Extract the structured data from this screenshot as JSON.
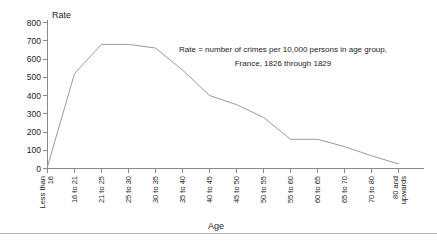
{
  "chart_data": {
    "type": "line",
    "title": "",
    "xlabel": "Age",
    "ylabel": "Rate",
    "ylim": [
      0,
      800
    ],
    "ytick_labels": [
      "0",
      "100",
      "200",
      "300",
      "400",
      "500",
      "600",
      "700",
      "800"
    ],
    "ytick_values": [
      0,
      100,
      200,
      300,
      400,
      500,
      600,
      700,
      800
    ],
    "grid": false,
    "legend": "none",
    "categories": [
      "Less than 16",
      "16 to 21",
      "21 to 25",
      "25 to 30",
      "30 to 35",
      "35 to 40",
      "40 to 45",
      "45 to 50",
      "50 to 55",
      "55 to 60",
      "60 to 65",
      "65 to 70",
      "70 to 80",
      "80 and upwards"
    ],
    "values": [
      10,
      520,
      680,
      680,
      660,
      540,
      400,
      350,
      280,
      160,
      160,
      120,
      70,
      25
    ],
    "series": [
      {
        "name": "Crime rate by age group",
        "values": [
          10,
          520,
          680,
          680,
          660,
          540,
          400,
          350,
          280,
          160,
          160,
          120,
          70,
          25
        ]
      }
    ],
    "annotations": [
      "Rate = number of crimes per 10,000 persons in age group,",
      "France, 1826 through 1829"
    ],
    "line_color": "#9a9a9a",
    "axis_color": "#8a8a8a"
  }
}
